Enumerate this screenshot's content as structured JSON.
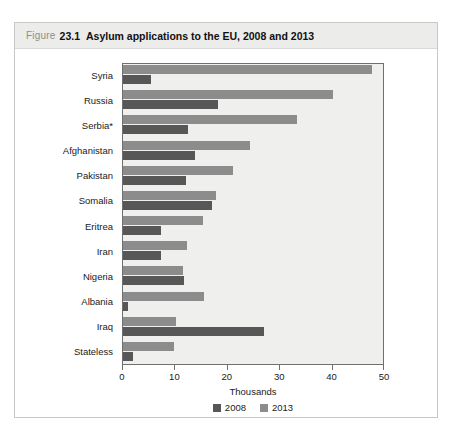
{
  "figure": {
    "label": "Figure",
    "number": "23.1",
    "title": "Asylum applications to the EU, 2008 and 2013"
  },
  "chart_data": {
    "type": "bar",
    "orientation": "horizontal",
    "title": "Asylum applications to the EU, 2008 and 2013",
    "xlabel": "Thousands",
    "ylabel": "",
    "xlim": [
      0,
      50
    ],
    "xticks": [
      0,
      10,
      20,
      30,
      40,
      50
    ],
    "xtick_labels": [
      "0",
      "10",
      "20",
      "30",
      "40",
      "50"
    ],
    "grid": false,
    "legend_position": "bottom",
    "categories": [
      "Syria",
      "Russia",
      "Serbia*",
      "Afghanistan",
      "Pakistan",
      "Somalia",
      "Eritrea",
      "Iran",
      "Nigeria",
      "Albania",
      "Iraq",
      "Stateless"
    ],
    "series": [
      {
        "name": "2008",
        "color": "#575757",
        "values": [
          5.3,
          18.1,
          12.4,
          13.7,
          12.0,
          16.9,
          7.3,
          7.3,
          11.6,
          0.9,
          26.9,
          1.9
        ]
      },
      {
        "name": "2013",
        "color": "#8c8c8c",
        "values": [
          47.5,
          40.1,
          33.2,
          24.2,
          21.0,
          17.8,
          15.3,
          12.2,
          11.5,
          15.5,
          10.1,
          9.7
        ]
      }
    ]
  },
  "colors": {
    "series_2008": "#575757",
    "series_2013": "#8c8c8c",
    "plot_background": "#efefed",
    "header_background": "#ececea",
    "axis": "#6f6f6f"
  }
}
